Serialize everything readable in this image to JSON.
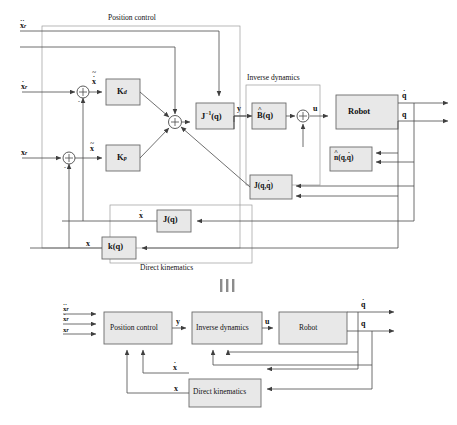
{
  "figure": {
    "equivalence_symbol": "|||",
    "group_labels": {
      "position_control": "Position control",
      "inverse_dynamics": "Inverse dynamics",
      "direct_kinematics": "Direct kinematics"
    }
  },
  "top_diagram": {
    "inputs": [
      {
        "name": "acceleration-reference",
        "base": "x",
        "accent": "ddot",
        "sub": "r"
      },
      {
        "name": "velocity-reference",
        "base": "x",
        "accent": "dot",
        "sub": "r"
      },
      {
        "name": "position-reference",
        "base": "x",
        "accent": "none",
        "sub": "r"
      }
    ],
    "blocks": [
      {
        "id": "kd",
        "label": "K",
        "sub": "d",
        "name": "gain-block-kd"
      },
      {
        "id": "kp",
        "label": "K",
        "sub": "p",
        "name": "gain-block-kp"
      },
      {
        "id": "jinv",
        "label": "J",
        "sup": "-1",
        "arg": "(q)",
        "name": "inverse-jacobian-block"
      },
      {
        "id": "bhat",
        "label": "B",
        "accent": "hat",
        "arg": "(q)",
        "name": "inertia-estimate-block"
      },
      {
        "id": "robot",
        "label": "Robot",
        "name": "robot-block"
      },
      {
        "id": "nhat",
        "label": "n",
        "accent": "hat",
        "arg": "(q, q)",
        "name": "nonlinear-terms-block"
      },
      {
        "id": "jqqdot",
        "label": "J",
        "arg": "(q, q)",
        "name": "jacobian-derivative-block"
      },
      {
        "id": "jq",
        "label": "J",
        "arg": "(q)",
        "name": "jacobian-block"
      },
      {
        "id": "kq",
        "label": "k",
        "arg": "(q)",
        "name": "forward-kinematics-block"
      }
    ],
    "signal_labels": {
      "velocity_error": {
        "base": "x",
        "accent": "tildedot"
      },
      "position_error": {
        "base": "x",
        "accent": "tilde"
      },
      "y": "y",
      "u": "u",
      "q_dot": {
        "base": "q",
        "accent": "dot"
      },
      "q": {
        "base": "q",
        "accent": "none"
      },
      "x_dot": {
        "base": "x",
        "accent": "dot"
      },
      "x": {
        "base": "x",
        "accent": "none"
      }
    },
    "summing_signs": {
      "plus": "+",
      "minus": "-"
    }
  },
  "bottom_diagram": {
    "inputs": [
      {
        "name": "acceleration-reference",
        "base": "x",
        "accent": "ddot",
        "sub": "r"
      },
      {
        "name": "velocity-reference",
        "base": "x",
        "accent": "dot",
        "sub": "r"
      },
      {
        "name": "position-reference",
        "base": "x",
        "accent": "none",
        "sub": "r"
      }
    ],
    "blocks": [
      {
        "id": "position_control",
        "label": "Position control",
        "name": "position-control-block"
      },
      {
        "id": "inverse_dynamics",
        "label": "Inverse dynamics",
        "name": "inverse-dynamics-block"
      },
      {
        "id": "robot",
        "label": "Robot",
        "name": "robot-block"
      },
      {
        "id": "direct_kinematics",
        "label": "Direct kinematics",
        "name": "direct-kinematics-block"
      }
    ],
    "signal_labels": {
      "y": "y",
      "u": "u",
      "q_dot": {
        "base": "q",
        "accent": "dot"
      },
      "q": {
        "base": "q",
        "accent": "none"
      },
      "x_dot": {
        "base": "x",
        "accent": "dot"
      },
      "x": {
        "base": "x",
        "accent": "none"
      }
    }
  },
  "colors": {
    "line": "#4a4a4a",
    "block_fill": "#e8e8e8",
    "block_stroke": "#6b6b6b",
    "group_stroke": "#8a8a8a",
    "text": "#111111"
  }
}
